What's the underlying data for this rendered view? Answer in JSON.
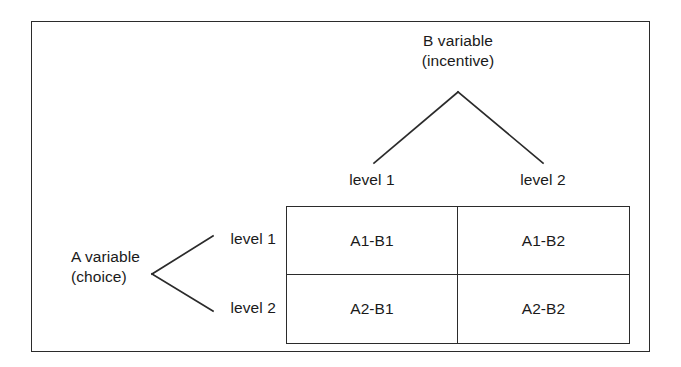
{
  "figure": {
    "title_b": "B variable\n(incentive)",
    "title_a": "A variable\n(choice)"
  },
  "b_variable": {
    "name": "B variable",
    "qualifier": "(incentive)",
    "levels": [
      "level 1",
      "level 2"
    ]
  },
  "a_variable": {
    "name": "A variable",
    "qualifier": "(choice)",
    "levels": [
      "level 1",
      "level 2"
    ]
  },
  "matrix": {
    "columns": [
      "level 1",
      "level 2"
    ],
    "rows": [
      "level 1",
      "level 2"
    ],
    "cells": [
      [
        "A1-B1",
        "A1-B2"
      ],
      [
        "A2-B1",
        "A2-B2"
      ]
    ]
  },
  "colors": {
    "line": "#2b2b2b",
    "text": "#1a1a1a",
    "background": "#ffffff"
  }
}
